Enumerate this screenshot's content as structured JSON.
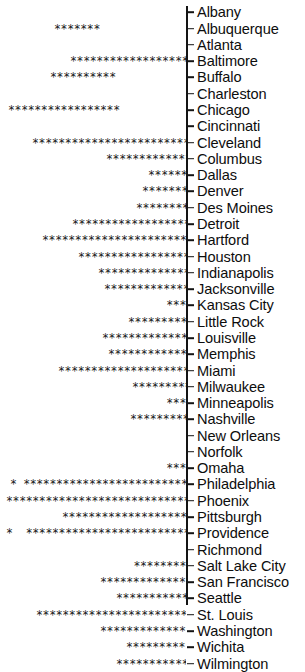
{
  "chart_data": {
    "type": "bar",
    "orientation": "horizontal",
    "title": "",
    "subtitle": "",
    "xlabel": "",
    "ylabel": "",
    "legend": [],
    "grid": false,
    "axis": {
      "spine": "vertical-right-of-bars",
      "ticks": "one-per-category",
      "tick_labels_position": "right"
    },
    "glyph": "*",
    "categories": [
      "Albany",
      "Albuquerque",
      "Atlanta",
      "Baltimore",
      "Buffalo",
      "Charleston",
      "Chicago",
      "Cincinnati",
      "Cleveland",
      "Columbus",
      "Dallas",
      "Denver",
      "Des Moines",
      "Detroit",
      "Hartford",
      "Houston",
      "Indianapolis",
      "Jacksonville",
      "Kansas City",
      "Little Rock",
      "Louisville",
      "Memphis",
      "Miami",
      "Milwaukee",
      "Minneapolis",
      "Nashville",
      "New Orleans",
      "Norfolk",
      "Omaha",
      "Philadelphia",
      "Phoenix",
      "Pittsburgh",
      "Providence",
      "Richmond",
      "Salt Lake City",
      "San Francisco",
      "Seattle",
      "St. Louis",
      "Washington",
      "Wichita",
      "Wilmington"
    ],
    "values": [
      0,
      7,
      0,
      28,
      13,
      0,
      27,
      0,
      34,
      15,
      6,
      7,
      8,
      21,
      26,
      21,
      17,
      16,
      3,
      10,
      16,
      13,
      24,
      9,
      3,
      9,
      0,
      0,
      3,
      40,
      42,
      22,
      39,
      0,
      8,
      15,
      12,
      27,
      16,
      10,
      12
    ],
    "rows": [
      {
        "label": "Albany",
        "stars": "",
        "left": 186,
        "right": 186,
        "detached": false
      },
      {
        "label": "Albuquerque",
        "stars": "*******",
        "left": 54,
        "right": 100,
        "detached": false
      },
      {
        "label": "Atlanta",
        "stars": "",
        "left": 186,
        "right": 186,
        "detached": false
      },
      {
        "label": "Baltimore",
        "stars": "****************************",
        "left": 70,
        "right": 186,
        "detached": false
      },
      {
        "label": "Buffalo",
        "stars": "*************",
        "left": 50,
        "right": 116,
        "detached": false
      },
      {
        "label": "Charleston",
        "stars": "",
        "left": 186,
        "right": 186,
        "detached": false
      },
      {
        "label": "Chicago",
        "stars": "***************************",
        "left": 8,
        "right": 120,
        "detached": false
      },
      {
        "label": "Cincinnati",
        "stars": "",
        "left": 186,
        "right": 186,
        "detached": false
      },
      {
        "label": "Cleveland",
        "stars": "**********************************",
        "left": 32,
        "right": 186,
        "detached": false
      },
      {
        "label": "Columbus",
        "stars": "***************",
        "left": 106,
        "right": 186,
        "detached": false
      },
      {
        "label": "Dallas",
        "stars": "******",
        "left": 148,
        "right": 186,
        "detached": false
      },
      {
        "label": "Denver",
        "stars": "*******",
        "left": 142,
        "right": 186,
        "detached": false
      },
      {
        "label": "Des Moines",
        "stars": "********",
        "left": 136,
        "right": 186,
        "detached": false
      },
      {
        "label": "Detroit",
        "stars": "*********************",
        "left": 72,
        "right": 186,
        "detached": false
      },
      {
        "label": "Hartford",
        "stars": "**************************",
        "left": 42,
        "right": 186,
        "detached": false
      },
      {
        "label": "Houston",
        "stars": "*********************",
        "left": 78,
        "right": 186,
        "detached": false
      },
      {
        "label": "Indianapolis",
        "stars": "*****************",
        "left": 98,
        "right": 186,
        "detached": false
      },
      {
        "label": "Jacksonville",
        "stars": "****************",
        "left": 104,
        "right": 186,
        "detached": false
      },
      {
        "label": "Kansas City",
        "stars": "***",
        "left": 165,
        "right": 186,
        "detached": false
      },
      {
        "label": "Little Rock",
        "stars": "**********",
        "left": 128,
        "right": 186,
        "detached": false
      },
      {
        "label": "Louisville",
        "stars": "****************",
        "left": 102,
        "right": 186,
        "detached": false
      },
      {
        "label": "Memphis",
        "stars": "*************",
        "left": 108,
        "right": 186,
        "detached": false
      },
      {
        "label": "Miami",
        "stars": "************************",
        "left": 58,
        "right": 186,
        "detached": false
      },
      {
        "label": "Milwaukee",
        "stars": "*********",
        "left": 132,
        "right": 186,
        "detached": false
      },
      {
        "label": "Minneapolis",
        "stars": "***",
        "left": 165,
        "right": 186,
        "detached": false
      },
      {
        "label": "Nashville",
        "stars": "*********",
        "left": 130,
        "right": 186,
        "detached": false
      },
      {
        "label": "New Orleans",
        "stars": "",
        "left": 186,
        "right": 186,
        "detached": false
      },
      {
        "label": "Norfolk",
        "stars": "",
        "left": 186,
        "right": 186,
        "detached": false
      },
      {
        "label": "Omaha",
        "stars": "***",
        "left": 162,
        "right": 186,
        "detached": false
      },
      {
        "label": "Philadelphia",
        "stars": "* ***************************************",
        "left": 10,
        "right": 186,
        "detached": true
      },
      {
        "label": "Phoenix",
        "stars": "******************************************",
        "left": 6,
        "right": 186,
        "detached": false
      },
      {
        "label": "Pittsburgh",
        "stars": "**********************",
        "left": 62,
        "right": 186,
        "detached": false
      },
      {
        "label": "Providence",
        "stars": "*  ***************************************",
        "left": 6,
        "right": 186,
        "detached": true
      },
      {
        "label": "Richmond",
        "stars": "",
        "left": 186,
        "right": 186,
        "detached": false
      },
      {
        "label": "Salt Lake City",
        "stars": "********",
        "left": 132,
        "right": 186,
        "detached": false
      },
      {
        "label": "San Francisco",
        "stars": "***************",
        "left": 100,
        "right": 186,
        "detached": false
      },
      {
        "label": "Seattle",
        "stars": "************",
        "left": 116,
        "right": 186,
        "detached": false
      },
      {
        "label": "St. Louis",
        "stars": "***************************",
        "left": 36,
        "right": 186,
        "detached": false
      },
      {
        "label": "Washington",
        "stars": "****************",
        "left": 100,
        "right": 186,
        "detached": false
      },
      {
        "label": "Wichita",
        "stars": "**********",
        "left": 126,
        "right": 186,
        "detached": false
      },
      {
        "label": "Wilmington",
        "stars": "************",
        "left": 116,
        "right": 186,
        "detached": false
      }
    ]
  },
  "colors": {
    "background": "#ffffff",
    "ink": "#141414",
    "label": "#0d0d0d"
  }
}
